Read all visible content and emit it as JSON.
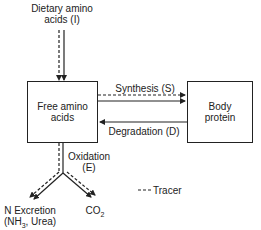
{
  "diagram": {
    "inputs": {
      "dietary_line1": "Dietary amino",
      "dietary_line2": "acids (I)"
    },
    "nodes": {
      "free_amino_line1": "Free amino",
      "free_amino_line2": "acids",
      "body_protein_line1": "Body",
      "body_protein_line2": "protein"
    },
    "flows": {
      "synthesis": "Synthesis (S)",
      "degradation": "Degradation (D)",
      "oxidation_line1": "Oxidation",
      "oxidation_line2": "(E)"
    },
    "outputs": {
      "n_excretion_line1": "N Excretion",
      "n_excretion_line2_prefix": "(NH",
      "n_excretion_line2_sub": "3",
      "n_excretion_line2_suffix": ", Urea)",
      "co2_prefix": "CO",
      "co2_sub": "2"
    },
    "legend": {
      "tracer": "Tracer"
    }
  }
}
